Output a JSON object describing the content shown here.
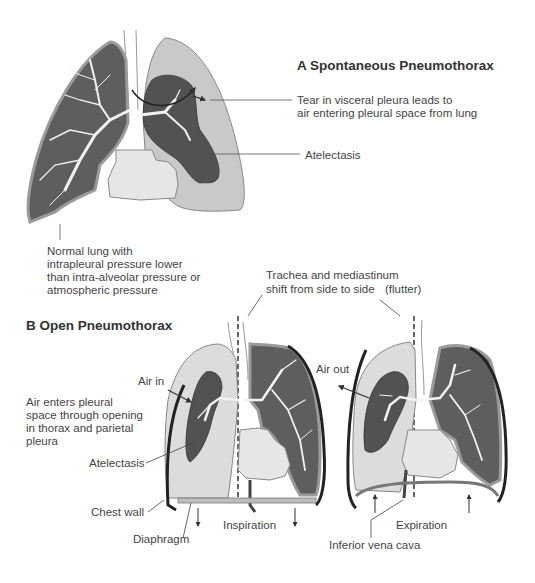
{
  "panel_a": {
    "title": "A  Spontaneous Pneumothorax",
    "labels": {
      "tear_line1": "Tear in visceral pleura leads to",
      "tear_line2": "air entering pleural space from lung",
      "atelectasis": "Atelectasis",
      "normal_line1": "Normal lung with",
      "normal_line2": "intrapleural pressure lower",
      "normal_line3": "than intra-alveolar pressure or",
      "normal_line4": "atmospheric pressure"
    }
  },
  "panel_b": {
    "title": "B  Open Pneumothorax",
    "labels": {
      "trachea_line1": "Trachea and mediastinum",
      "trachea_line2": "shift from side to side",
      "flutter": "(flutter)",
      "air_in": "Air in",
      "air_out": "Air out",
      "air_enters_line1": "Air enters pleural",
      "air_enters_line2": "space through opening",
      "air_enters_line3": "in thorax and parietal",
      "air_enters_line4": "pleura",
      "atelectasis": "Atelectasis",
      "chest_wall": "Chest wall",
      "diaphragm": "Diaphragm",
      "inspiration": "Inspiration",
      "expiration": "Expiration",
      "ivc": "Inferior vena cava"
    }
  },
  "colors": {
    "lung_dark": "#5e5e5e",
    "lung_collapsed": "#525252",
    "pleural_space": "#c9c9c9",
    "pleural_space_light": "#dcdcdc",
    "heart": "#e6e6e6",
    "bronchi": "#f2f2f2",
    "chest_wall": "#222222"
  }
}
